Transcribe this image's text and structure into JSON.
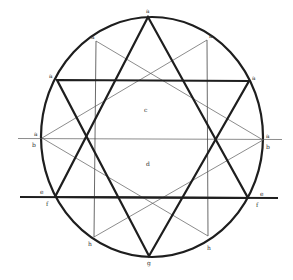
{
  "diagram": {
    "labels": {
      "top": "a",
      "upper_left": "a",
      "upper_right": "a",
      "hexagram_left": "a",
      "hexagram_right": "a",
      "mid_left_a": "a",
      "mid_left_b": "b",
      "mid_right_a": "a",
      "mid_right_b": "b",
      "center_upper": "c",
      "center_lower": "d",
      "lower_left_e": "e",
      "lower_left_f": "f",
      "lower_right_e": "e",
      "lower_right_f": "f",
      "bottom_left_h": "h",
      "bottom_right_h": "h",
      "bottom": "g"
    },
    "colors": {
      "thick_line": "#1e1e1e",
      "thin_line": "#5a5a5a",
      "background": "#ffffff"
    }
  }
}
